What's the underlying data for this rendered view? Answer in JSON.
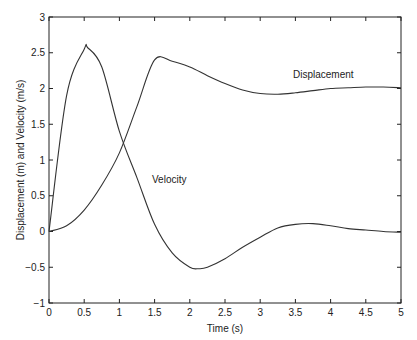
{
  "chart_data": {
    "type": "line",
    "title": "",
    "xlabel": "Time (s)",
    "ylabel": "Displacement (m) and Velocity (m/s)",
    "xlim": [
      0,
      5
    ],
    "ylim": [
      -1,
      3
    ],
    "xticks": [
      "0",
      "0.5",
      "1",
      "1.5",
      "2",
      "2.5",
      "3",
      "3.5",
      "4",
      "4.5",
      "5"
    ],
    "yticks": [
      "−1",
      "−0.5",
      "0",
      "0.5",
      "1",
      "1.5",
      "2",
      "2.5",
      "3"
    ],
    "grid": false,
    "annotations": [
      {
        "text": "Displacement",
        "x": 3.5,
        "y": 2.25
      },
      {
        "text": "Velocity",
        "x": 1.05,
        "y": 0.65
      }
    ],
    "series": [
      {
        "name": "Displacement",
        "x": [
          0,
          0.25,
          0.5,
          0.75,
          1,
          1.25,
          1.5,
          1.75,
          2,
          2.25,
          2.5,
          2.75,
          3,
          3.25,
          3.5,
          3.75,
          4,
          4.25,
          4.5,
          4.75,
          5
        ],
        "values": [
          0,
          0.08,
          0.3,
          0.65,
          1.1,
          1.75,
          2.4,
          2.38,
          2.3,
          2.18,
          2.07,
          1.98,
          1.93,
          1.92,
          1.94,
          1.97,
          2.0,
          2.01,
          2.02,
          2.02,
          2.01
        ]
      },
      {
        "name": "Velocity",
        "x": [
          0,
          0.25,
          0.5,
          0.55,
          0.75,
          1,
          1.25,
          1.5,
          1.75,
          2,
          2.13,
          2.25,
          2.5,
          2.75,
          3,
          3.25,
          3.5,
          3.75,
          4,
          4.25,
          4.5,
          4.75,
          5
        ],
        "values": [
          0,
          1.9,
          2.55,
          2.57,
          2.3,
          1.4,
          0.75,
          0.1,
          -0.3,
          -0.5,
          -0.52,
          -0.5,
          -0.38,
          -0.22,
          -0.08,
          0.05,
          0.1,
          0.11,
          0.08,
          0.04,
          0.02,
          0,
          -0.01
        ]
      }
    ]
  }
}
